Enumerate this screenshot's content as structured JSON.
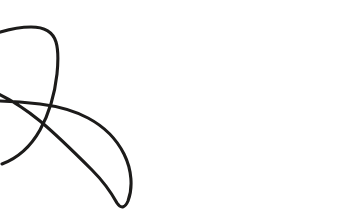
{
  "canvas": {
    "width": 360,
    "height": 219,
    "background_color": "#ffffff",
    "description": "Single continuous hand-drawn curved line forming two loops and a long sweeping arc"
  },
  "drawing": {
    "name": "continuous-looping-curve",
    "stroke_color": "#1c1b1a",
    "stroke_width": 3.1,
    "stroke_linecap": "round",
    "stroke_linejoin": "round",
    "fill": "none",
    "path": "M -6 34 C 6 30 18 27 31 27 C 44 27 53 32 56 42 C 59 52 58 64 57 74 C 55 92 50 112 40 130 C 31 146 18 158 2 164 M -6 92 C 8 98 24 108 40 121 C 58 136 76 154 92 170 C 104 182 112 194 117 203 C 121 209 125 208 128 201 C 133 188 132 170 124 154 C 116 138 103 126 88 118 C 73 110 56 106 40 104 C 24 102 8 101 -6 101",
    "segments": [
      {
        "name": "upper-left-arc",
        "start": [
          -6,
          34
        ],
        "apex": [
          35,
          27
        ],
        "end": [
          57,
          74
        ]
      },
      {
        "name": "left-loop-descending",
        "start": [
          57,
          74
        ],
        "end": [
          2,
          164
        ]
      },
      {
        "name": "lower-left-ascending",
        "start": [
          -6,
          92
        ],
        "end": [
          92,
          170
        ]
      },
      {
        "name": "center-teardrop-loop",
        "tip": [
          117,
          203
        ],
        "crossing": [
          177,
          122
        ]
      },
      {
        "name": "right-sweeping-arc",
        "peak": [
          280,
          100
        ],
        "end": [
          342,
          145
        ]
      }
    ],
    "crossings": [
      {
        "name": "upper-crossing",
        "x": 56,
        "y": 70
      },
      {
        "name": "lower-crossing",
        "x": 177,
        "y": 122
      }
    ],
    "endpoints": [
      {
        "name": "left-upper-endpoint",
        "x": 0,
        "y": 34
      },
      {
        "name": "left-lower-endpoint",
        "x": 0,
        "y": 131
      },
      {
        "name": "right-endpoint",
        "x": 342,
        "y": 145
      }
    ]
  }
}
